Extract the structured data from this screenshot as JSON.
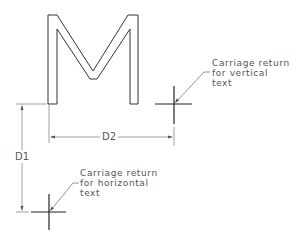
{
  "diagram": {
    "letter": "M",
    "dimensions": {
      "d1": "D1",
      "d2": "D2"
    },
    "callouts": {
      "vertical": {
        "line1": "Carriage return",
        "line2": "for vertical",
        "line3": "text"
      },
      "horizontal": {
        "line1": "Carriage return",
        "line2": "for horizontal",
        "line3": "text"
      }
    },
    "colors": {
      "outline": "#333333",
      "dimension": "#777777",
      "text": "#555555",
      "background": "#ffffff"
    }
  }
}
